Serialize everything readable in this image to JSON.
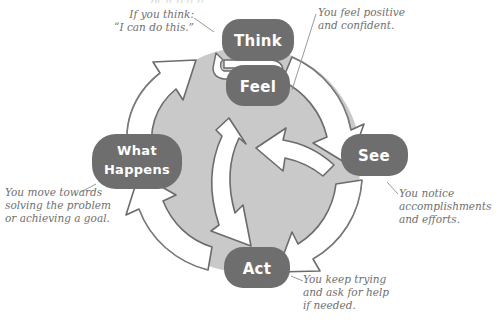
{
  "diagram": {
    "colors": {
      "circle_fill": "#c9c9c9",
      "node_fill": "#6e6e6e",
      "node_text": "#ffffff",
      "arrow_fill": "#ffffff",
      "arrow_stroke": "#6b6b6b",
      "annotation_text": "#6f6f6f",
      "leader_line": "#9a9a9a",
      "background": "#ffffff"
    },
    "nodes": [
      {
        "id": "think",
        "label": "Think",
        "position": "top"
      },
      {
        "id": "feel",
        "label": "Feel",
        "position": "top-below"
      },
      {
        "id": "see",
        "label": "See",
        "position": "right"
      },
      {
        "id": "act",
        "label": "Act",
        "position": "bottom"
      },
      {
        "id": "what_happens",
        "label_line1": "What",
        "label_line2": "Happens",
        "position": "left"
      }
    ],
    "annotations": [
      {
        "id": "think-annotation",
        "for_node": "think",
        "text": "If you think:\n“I can do this.”"
      },
      {
        "id": "feel-annotation",
        "for_node": "feel",
        "text": "You feel positive\nand confident."
      },
      {
        "id": "see-annotation",
        "for_node": "see",
        "text": "You notice\naccomplishments\nand efforts."
      },
      {
        "id": "act-annotation",
        "for_node": "act",
        "text": "You keep trying\nand ask for help\nif needed."
      },
      {
        "id": "what-happens-annotation",
        "for_node": "what_happens",
        "text": "You move towards\nsolving the problem\nor achieving a goal."
      }
    ],
    "flow": [
      {
        "from": "what_happens",
        "to": "think",
        "kind": "outer-ring"
      },
      {
        "from": "feel",
        "to": "see",
        "kind": "outer-ring"
      },
      {
        "from": "see",
        "to": "act",
        "kind": "outer-ring"
      },
      {
        "from": "act",
        "to": "what_happens",
        "kind": "outer-ring"
      },
      {
        "from": "think",
        "to": "feel",
        "kind": "double-headed-link"
      },
      {
        "from": "act",
        "to": "think",
        "kind": "inner-arrow"
      },
      {
        "from": "see",
        "to": "center",
        "kind": "inner-arrow"
      }
    ],
    "top_cropped_fragment": "pt  n     p   g      g"
  }
}
